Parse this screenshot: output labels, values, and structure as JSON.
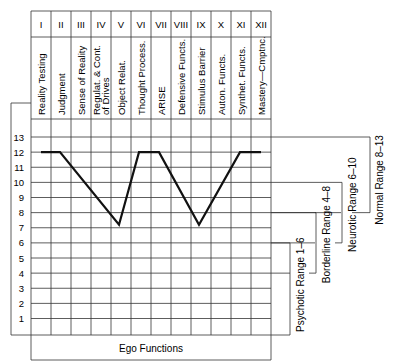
{
  "chart_data": {
    "type": "line",
    "title": "",
    "xlabel": "Ego Functions",
    "ylabel": "",
    "ylim": [
      0,
      13
    ],
    "yticks": [
      1,
      2,
      3,
      4,
      5,
      6,
      7,
      8,
      9,
      10,
      11,
      12,
      13
    ],
    "grid": true,
    "categories_roman": [
      "I",
      "II",
      "III",
      "IV",
      "V",
      "VI",
      "VII",
      "VIII",
      "IX",
      "X",
      "XI",
      "XII"
    ],
    "categories": [
      "Reality Testing",
      "Judgment",
      "Sense of Reality",
      "Regulat. & Cont. of Drives",
      "Object Relat.",
      "Thought Process.",
      "ARISE",
      "Defensive Functs.",
      "Stimulus Barrier",
      "Auton. Functs.",
      "Synthet. Functs.",
      "Mastery—Cmptnc."
    ],
    "series": [
      {
        "name": "Ego function profile",
        "values": [
          12,
          12,
          10.6,
          8.9,
          7.2,
          12,
          12,
          9.6,
          7.2,
          9.6,
          12,
          12
        ]
      }
    ],
    "annotations": [
      {
        "label": "Normal Range 8–13",
        "range": [
          8,
          13
        ]
      },
      {
        "label": "Neurotic Range 6–10",
        "range": [
          6,
          10
        ]
      },
      {
        "label": "Borderline Range 4–8",
        "range": [
          4,
          8
        ]
      },
      {
        "label": "Psychotic Range 1–6",
        "range": [
          1,
          6
        ]
      }
    ]
  },
  "labels": {
    "x_axis": "Ego Functions",
    "normal": "Normal Range 8–13",
    "neurotic": "Neurotic Range 6–10",
    "borderline": "Borderline Range 4–8",
    "psychotic": "Psychotic Range 1–6"
  }
}
